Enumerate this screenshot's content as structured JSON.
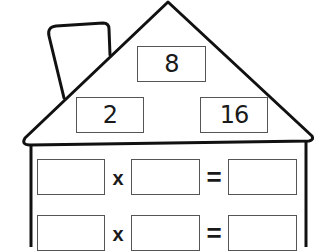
{
  "worksheet": {
    "title": "Fact Family House",
    "roof": {
      "top_number": "8",
      "left_number": "2",
      "right_number": "16"
    },
    "equations": [
      {
        "factor1": "",
        "operator": "x",
        "factor2": "",
        "equals": "=",
        "result": ""
      },
      {
        "factor1": "",
        "operator": "x",
        "factor2": "",
        "equals": "=",
        "result": ""
      }
    ]
  },
  "colors": {
    "outline": "#111111",
    "box_border": "#555555",
    "background": "#ffffff",
    "text": "#1a1a1a"
  }
}
